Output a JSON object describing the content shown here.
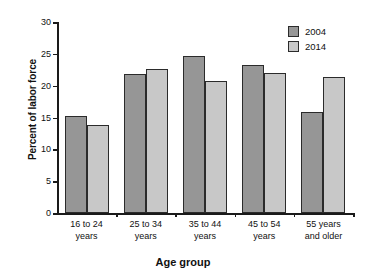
{
  "chart_data": {
    "type": "bar",
    "title": "",
    "xlabel": "Age group",
    "ylabel": "Percent of labor force",
    "categories": [
      "16 to 24\nyears",
      "25 to 34\nyears",
      "35 to 44\nyears",
      "45 to 54\nyears",
      "55 years\nand older"
    ],
    "category_lines": [
      [
        "16 to 24",
        "years"
      ],
      [
        "25 to 34",
        "years"
      ],
      [
        "35 to 44",
        "years"
      ],
      [
        "45 to 54",
        "years"
      ],
      [
        "55 years",
        "and older"
      ]
    ],
    "series": [
      {
        "name": "2004",
        "color": "#969696",
        "values": [
          15.3,
          21.8,
          24.6,
          23.2,
          15.9
        ]
      },
      {
        "name": "2014",
        "color": "#c8c8c8",
        "values": [
          13.8,
          22.6,
          20.8,
          22.0,
          21.4
        ]
      }
    ],
    "ylim": [
      0,
      30
    ],
    "ytick_values": [
      0,
      5,
      10,
      15,
      20,
      25,
      30
    ],
    "ytick_labels": [
      "0",
      "5",
      "10",
      "15",
      "20",
      "25",
      "30"
    ],
    "grid": false,
    "legend_position": "top-right"
  },
  "legend": {
    "entries": [
      {
        "label": "2004"
      },
      {
        "label": "2014"
      }
    ]
  }
}
